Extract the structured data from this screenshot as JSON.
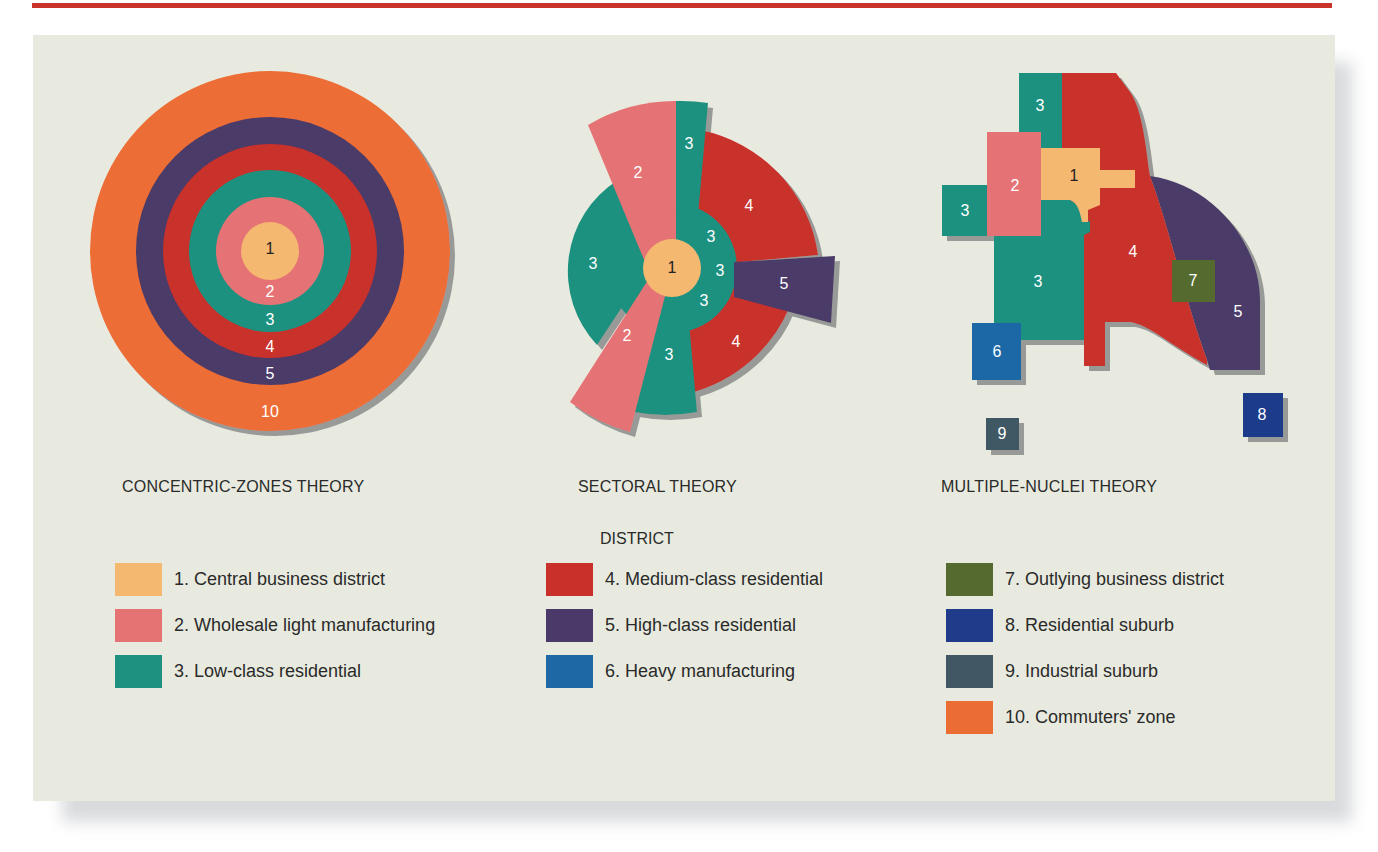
{
  "colors": {
    "1": "#f4b870",
    "2": "#e57374",
    "3": "#1f9180",
    "4": "#c9302a",
    "5": "#4b3a69",
    "6": "#1e68a6",
    "7": "#546a2e",
    "8": "#1f3b8a",
    "9": "#415864",
    "10": "#ec6d34",
    "panel_bg": "#e8eadf",
    "top_rule": "#c9342a"
  },
  "theories": [
    {
      "id": "concentric",
      "title": "CONCENTRIC-ZONES THEORY"
    },
    {
      "id": "sectoral",
      "title": "SECTORAL THEORY"
    },
    {
      "id": "multiple",
      "title": "MULTIPLE-NUCLEI THEORY"
    }
  ],
  "concentric": {
    "rings": [
      {
        "zone": "10",
        "label": "10"
      },
      {
        "zone": "5",
        "label": "5"
      },
      {
        "zone": "4",
        "label": "4"
      },
      {
        "zone": "3",
        "label": "3"
      },
      {
        "zone": "2",
        "label": "2"
      },
      {
        "zone": "1",
        "label": "1"
      }
    ]
  },
  "sectoral": {
    "labels": {
      "cbd": "1",
      "pink_top": "2",
      "pink_bottom": "2",
      "teal_top": "3",
      "teal_left": "3",
      "teal_bottom": "3",
      "teal_inner_a": "3",
      "teal_inner_b": "3",
      "teal_inner_c": "3",
      "red_top": "4",
      "red_bottom": "4",
      "purple": "5"
    }
  },
  "multiple": {
    "labels": {
      "cbd": "1",
      "wholesale": "2",
      "teal_top": "3",
      "teal_left": "3",
      "teal_main": "3",
      "medium": "4",
      "high": "5",
      "heavy": "6",
      "outlying": "7",
      "res_suburb": "8",
      "ind_suburb": "9"
    }
  },
  "legend": {
    "title": "DISTRICT",
    "columns": [
      [
        {
          "zone": "1",
          "label": "1. Central business district"
        },
        {
          "zone": "2",
          "label": "2. Wholesale light manufacturing"
        },
        {
          "zone": "3",
          "label": "3. Low-class residential"
        }
      ],
      [
        {
          "zone": "4",
          "label": "4. Medium-class residential"
        },
        {
          "zone": "5",
          "label": "5. High-class residential"
        },
        {
          "zone": "6",
          "label": "6. Heavy manufacturing"
        }
      ],
      [
        {
          "zone": "7",
          "label": "7. Outlying business district"
        },
        {
          "zone": "8",
          "label": "8. Residential suburb"
        },
        {
          "zone": "9",
          "label": "9. Industrial suburb"
        },
        {
          "zone": "10",
          "label": "10. Commuters' zone"
        }
      ]
    ]
  }
}
